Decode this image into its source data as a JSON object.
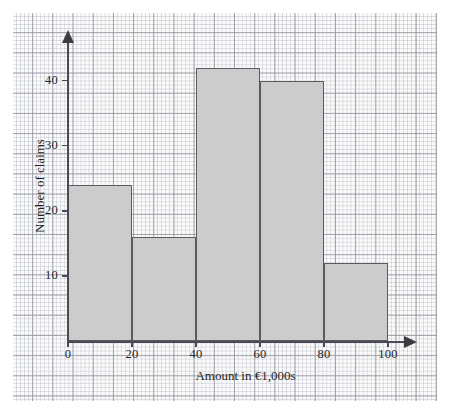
{
  "chart_data": {
    "type": "bar",
    "title": "",
    "subtitle": "",
    "xlabel": "Amount in €1,000s",
    "ylabel": "Number of claims",
    "bin_edges": [
      0,
      20,
      40,
      60,
      80,
      100
    ],
    "categories": [
      "0–20",
      "20–40",
      "40–60",
      "60–80",
      "80–100"
    ],
    "values": [
      24,
      16,
      42,
      40,
      12
    ],
    "xlim": [
      0,
      100
    ],
    "ylim": [
      0,
      45
    ],
    "x_ticks": [
      "0",
      "20",
      "40",
      "60",
      "80",
      "100"
    ],
    "y_ticks": [
      "10",
      "20",
      "30",
      "40"
    ],
    "grid": true,
    "legend": null,
    "bar_fill_color": "#cccccc",
    "bar_edge_color": "#5a5a60",
    "axis_color": "#4a4a52",
    "background_color": "#fbfbfb"
  },
  "axes": {
    "x_title": "Amount in €1,000s",
    "y_title": "Number of claims"
  }
}
